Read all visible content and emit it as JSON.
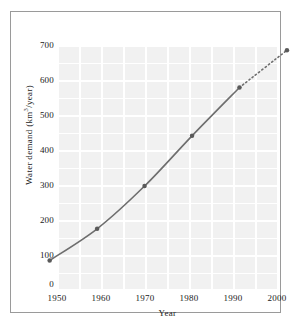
{
  "page": {
    "bleed_text_left": "",
    "bleed_text_right": ""
  },
  "figure": {
    "x_axis_title": "Year",
    "y_axis_title_prefix": "Water demand (km",
    "y_axis_title_exponent": "3",
    "y_axis_title_suffix": "/year)"
  },
  "chart_data": {
    "type": "line",
    "title": "",
    "xlabel": "Year",
    "ylabel": "Water demand (km3/year)",
    "xlim": [
      1950,
      2000
    ],
    "ylim": [
      0,
      700
    ],
    "grid": true,
    "legend": "none",
    "x": [
      1950,
      1960,
      1970,
      1980,
      1990,
      2000
    ],
    "xtick_labels": [
      "1950",
      "1960",
      "1970",
      "1980",
      "1990",
      "2000"
    ],
    "ytick_values": [
      0,
      100,
      200,
      300,
      400,
      500,
      600,
      700
    ],
    "ytick_labels": [
      "0",
      "100",
      "200",
      "300",
      "400",
      "500",
      "600",
      "700"
    ],
    "series": [
      {
        "name": "Water demand",
        "values": [
          95,
          180,
          295,
          430,
          560,
          660
        ],
        "marker": "circle",
        "marker_color": "#5a5a5a",
        "line_color": "#6e6e6e",
        "solid_through": 1990,
        "dashed_from": 1990,
        "dashed_note": "1990-2000 segment drawn as dotted projection"
      }
    ],
    "plot_background": "#f1f1f1",
    "gridline_color": "#ffffff",
    "frame_color": "#9a9a9a"
  }
}
